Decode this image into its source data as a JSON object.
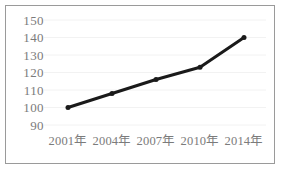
{
  "chart_data": {
    "type": "line",
    "title": "",
    "subtitle": "",
    "xlabel": "",
    "ylabel": "",
    "categories": [
      "2001年",
      "2004年",
      "2007年",
      "2010年",
      "2014年"
    ],
    "values": [
      100,
      108,
      116,
      123,
      140
    ],
    "series": [
      {
        "name": "",
        "values": [
          100,
          108,
          116,
          123,
          140
        ]
      }
    ],
    "ylim": [
      90,
      150
    ],
    "yticks": [
      90,
      100,
      110,
      120,
      130,
      140,
      150
    ],
    "ytick_labels": [
      "90",
      "100",
      "110",
      "120",
      "130",
      "140",
      "150"
    ],
    "grid": true,
    "grid_axis": "y",
    "legend": false,
    "legend_position": "none",
    "annotations": [],
    "colors": {
      "line": "#1a1a1a",
      "marker": "#1a1a1a",
      "grid": "#f2f2f2",
      "tick_text": "#7b7b7b",
      "frame": "#9a9a9a",
      "background": "#ffffff"
    },
    "style": {
      "line_width_px": 3,
      "marker": "circle",
      "marker_size_px": 5
    }
  }
}
